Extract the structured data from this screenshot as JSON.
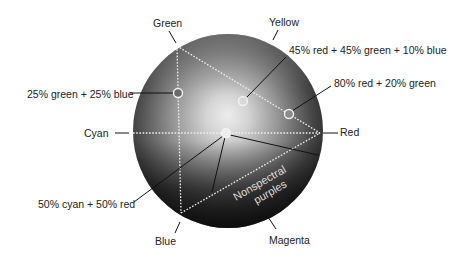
{
  "diagram": {
    "type": "color-sphere",
    "colors": {
      "sphere_highlight": "#f4f4f4",
      "sphere_mid": "#9a9a9a",
      "sphere_dark": "#151515",
      "dotted_line": "#f0f0f0",
      "leader_line": "#111111",
      "label_text": "#222222",
      "inner_text": "#dddddd"
    },
    "vertices": {
      "green": {
        "label": "Green"
      },
      "yellow": {
        "label": "Yellow"
      },
      "cyan": {
        "label": "Cyan"
      },
      "red": {
        "label": "Red"
      },
      "blue": {
        "label": "Blue"
      },
      "magenta": {
        "label": "Magenta"
      }
    },
    "mixture_points": [
      {
        "label": "25% green + 25% blue"
      },
      {
        "label": "45% red + 45% green + 10% blue"
      },
      {
        "label": "80% red + 20% green"
      },
      {
        "label": "50% cyan + 50% red"
      }
    ],
    "region_label": {
      "line1": "Nonspectral",
      "line2": "purples"
    }
  }
}
